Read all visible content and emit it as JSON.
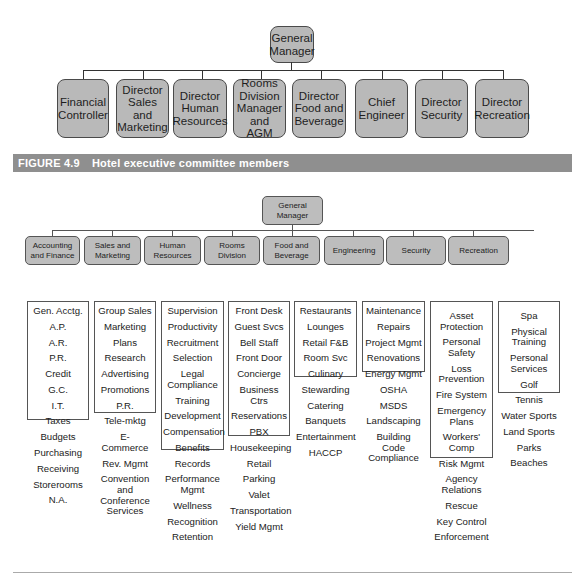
{
  "figure_4_9": {
    "top": {
      "label": "General Manager"
    },
    "members": [
      "Financial Controller",
      "Director Sales and Marketing",
      "Director Human Resources",
      "Rooms Division Manager and AGM",
      "Director Food and Beverage",
      "Chief Engineer",
      "Director Security",
      "Director Recreation"
    ],
    "caption": {
      "number": "FIGURE 4.9",
      "title": "Hotel executive committee members"
    }
  },
  "departments_chart": {
    "top": {
      "label": "General Manager"
    },
    "departments": [
      {
        "name": "Accounting and Finance",
        "functions": [
          "Gen. Acctg.",
          "A.P.",
          "A.R.",
          "P.R.",
          "Credit",
          "G.C.",
          "I.T.",
          "Taxes",
          "Budgets",
          "Purchasing",
          "Receiving",
          "Storerooms",
          "N.A."
        ]
      },
      {
        "name": "Sales and Marketing",
        "functions": [
          "Group Sales",
          "Marketing",
          "Plans",
          "Research",
          "Advertising",
          "Promotions",
          "P.R.",
          "Tele-mktg",
          "E- Commerce",
          "Rev. Mgmt",
          "Convention and Conference Services"
        ]
      },
      {
        "name": "Human Resources",
        "functions": [
          "Supervision",
          "Productivity",
          "Recruitment",
          "Selection",
          "Legal Compliance",
          "Training",
          "Development",
          "Compensation",
          "Benefits",
          "Records",
          "Performance Mgmt",
          "Wellness",
          "Recognition",
          "Retention"
        ]
      },
      {
        "name": "Rooms Division",
        "functions": [
          "Front Desk",
          "Guest Svcs",
          "Bell Staff",
          "Front Door",
          "Concierge",
          "Business Ctrs",
          "Reservations",
          "PBX",
          "Housekeeping",
          "Retail",
          "Parking",
          "Valet",
          "Transportation",
          "Yield Mgmt"
        ]
      },
      {
        "name": "Food and Beverage",
        "functions": [
          "Restaurants",
          "Lounges",
          "Retail F&B",
          "Room Svc",
          "Culinary",
          "Stewarding",
          "Catering",
          "Banquets",
          "Entertainment",
          "HACCP"
        ]
      },
      {
        "name": "Engineering",
        "functions": [
          "Maintenance",
          "Repairs",
          "Project Mgmt",
          "Renovations",
          "Energy Mgmt",
          "OSHA",
          "MSDS",
          "Landscaping",
          "Building Code Compliance"
        ]
      },
      {
        "name": "Security",
        "functions": [
          "Asset Protection",
          "Personal Safety",
          "Loss Prevention",
          "Fire System",
          "Emergency Plans",
          "Workers' Comp",
          "Risk Mgmt",
          "Agency Relations",
          "Rescue",
          "Key Control",
          "Enforcement"
        ]
      },
      {
        "name": "Recreation",
        "functions": [
          "Spa",
          "Physical Training",
          "Personal Services",
          "Golf",
          "Tennis",
          "Water Sports",
          "Land Sports",
          "Parks",
          "Beaches"
        ]
      }
    ]
  },
  "colors": {
    "box_fill": "#b9b9b9",
    "box_border": "#4a4a4a",
    "caption_bar": "#8f8f8f",
    "caption_text": "#ffffff",
    "line": "#333333"
  }
}
